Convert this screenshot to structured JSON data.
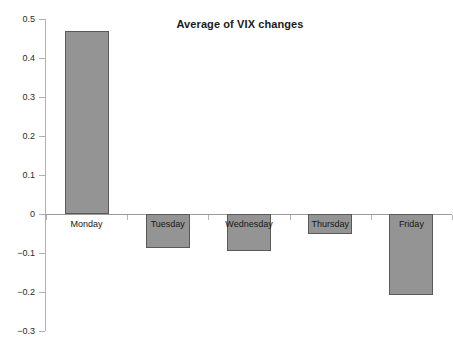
{
  "chart_data": {
    "type": "bar",
    "title": "Average of VIX changes",
    "xlabel": "",
    "ylabel": "",
    "categories": [
      "Monday",
      "Tuesday",
      "Wednesday",
      "Thursday",
      "Friday"
    ],
    "values": [
      0.469,
      -0.087,
      -0.096,
      -0.05,
      -0.207
    ],
    "ylim": [
      -0.3,
      0.5
    ],
    "ytick_labels": [
      "0.5",
      "0.4",
      "0.3",
      "0.2",
      "0.1",
      "0",
      "-0.1",
      "-0.2",
      "-0.3"
    ],
    "ytick_values": [
      0.5,
      0.4,
      0.3,
      0.2,
      0.1,
      0,
      -0.1,
      -0.2,
      -0.3
    ],
    "grid": false,
    "legend": false,
    "series": [
      {
        "name": "Average of VIX changes",
        "values": [
          0.469,
          -0.087,
          -0.096,
          -0.05,
          -0.207
        ]
      }
    ],
    "bar_fill_color": "#949494",
    "bar_border_color": "#595959",
    "axis_color": "#b0b0b0",
    "text_color": "#1a1a1a"
  }
}
